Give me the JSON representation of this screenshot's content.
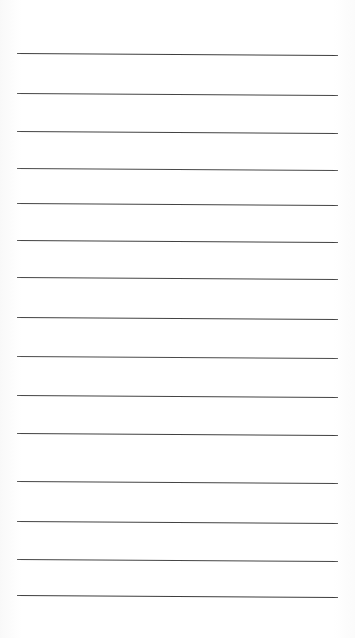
{
  "document": {
    "kind": "lined-paper-sheet",
    "title": "Blank Ruled Notebook Page",
    "page_width": 355,
    "page_height": 638,
    "background_color": "#ffffff",
    "text_content": ""
  },
  "rules": {
    "count": 15,
    "color": "#444444",
    "thickness": 1.5,
    "left_margin": 17,
    "right_margin": 17,
    "line_length": 321,
    "slant_px": 2,
    "lines": [
      {
        "index": 1,
        "y": 53,
        "x_start": 17,
        "x_end": 338,
        "y_end": 55,
        "thickness": 1.6,
        "color": "#3f3f3f"
      },
      {
        "index": 2,
        "y": 93,
        "x_start": 17,
        "x_end": 338,
        "y_end": 95,
        "thickness": 1.5,
        "color": "#454545"
      },
      {
        "index": 3,
        "y": 131,
        "x_start": 17,
        "x_end": 338,
        "y_end": 133,
        "thickness": 1.5,
        "color": "#434343"
      },
      {
        "index": 4,
        "y": 168,
        "x_start": 17,
        "x_end": 338,
        "y_end": 170,
        "thickness": 1.4,
        "color": "#4a4a4a"
      },
      {
        "index": 5,
        "y": 203,
        "x_start": 17,
        "x_end": 338,
        "y_end": 205,
        "thickness": 1.5,
        "color": "#444444"
      },
      {
        "index": 6,
        "y": 240,
        "x_start": 17,
        "x_end": 338,
        "y_end": 242,
        "thickness": 1.5,
        "color": "#424242"
      },
      {
        "index": 7,
        "y": 277,
        "x_start": 17,
        "x_end": 338,
        "y_end": 279,
        "thickness": 1.5,
        "color": "#464646"
      },
      {
        "index": 8,
        "y": 317,
        "x_start": 17,
        "x_end": 338,
        "y_end": 319,
        "thickness": 1.5,
        "color": "#434343"
      },
      {
        "index": 9,
        "y": 356,
        "x_start": 17,
        "x_end": 338,
        "y_end": 358,
        "thickness": 1.4,
        "color": "#4b4b4b"
      },
      {
        "index": 10,
        "y": 395,
        "x_start": 17,
        "x_end": 338,
        "y_end": 397,
        "thickness": 1.5,
        "color": "#444444"
      },
      {
        "index": 11,
        "y": 433,
        "x_start": 17,
        "x_end": 338,
        "y_end": 435,
        "thickness": 1.5,
        "color": "#414141"
      },
      {
        "index": 12,
        "y": 481,
        "x_start": 17,
        "x_end": 338,
        "y_end": 483,
        "thickness": 1.5,
        "color": "#454545"
      },
      {
        "index": 13,
        "y": 521,
        "x_start": 17,
        "x_end": 338,
        "y_end": 523,
        "thickness": 1.5,
        "color": "#434343"
      },
      {
        "index": 14,
        "y": 559,
        "x_start": 17,
        "x_end": 338,
        "y_end": 561,
        "thickness": 1.5,
        "color": "#464646"
      },
      {
        "index": 15,
        "y": 595,
        "x_start": 17,
        "x_end": 338,
        "y_end": 597,
        "thickness": 1.6,
        "color": "#3d3d3d"
      }
    ]
  }
}
